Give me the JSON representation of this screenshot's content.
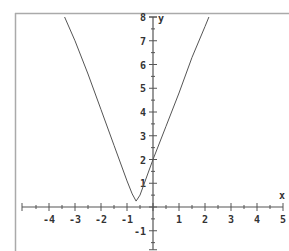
{
  "chart_data": {
    "type": "line",
    "title": "",
    "xlabel": "x",
    "ylabel": "y",
    "xlim": [
      -5,
      5
    ],
    "ylim": [
      -1.8,
      8
    ],
    "grid": false,
    "legend": null,
    "x_ticks": [
      -4,
      -3,
      -2,
      -1,
      1,
      2,
      3,
      4,
      5
    ],
    "y_ticks": [
      -1,
      1,
      2,
      3,
      4,
      5,
      6,
      7,
      8
    ],
    "x_tick_labels": [
      "-4",
      "-3",
      "-2",
      "-1",
      "1",
      "2",
      "3",
      "4",
      "5"
    ],
    "y_tick_labels": [
      "-1",
      "1",
      "2",
      "3",
      "4",
      "5",
      "6",
      "7",
      "8"
    ],
    "minor_tick_step": 0.5,
    "series": [
      {
        "name": "curve",
        "description": "V-shaped curve, approx y = |3x + 2| with slightly rounded vertex near (-0.65, 0.25)",
        "x": [
          -3.4,
          -3.0,
          -2.5,
          -2.0,
          -1.5,
          -1.0,
          -0.8,
          -0.65,
          -0.5,
          0.0,
          0.5,
          1.0,
          1.5,
          2.0,
          2.15
        ],
        "y": [
          8.0,
          7.0,
          5.6,
          4.1,
          2.6,
          1.1,
          0.55,
          0.25,
          0.5,
          2.0,
          3.4,
          4.8,
          6.3,
          7.6,
          8.0
        ]
      }
    ],
    "color": "#555555"
  },
  "axes": {
    "x_name": "x",
    "y_name": "y"
  }
}
